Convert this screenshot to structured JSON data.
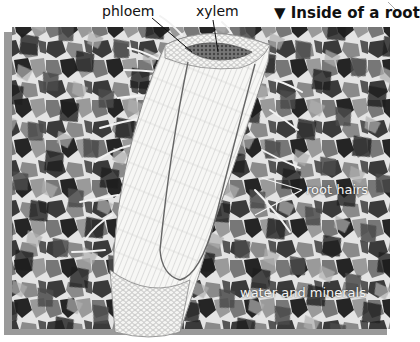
{
  "figure": {
    "title": "Inside of a root",
    "title_marker": "▼",
    "labels": {
      "phloem": "phloem",
      "xylem": "xylem",
      "root_hairs": "root hairs",
      "water_minerals": "water and minerals"
    }
  },
  "colors": {
    "background": "#ffffff",
    "soil_dark": "#2a2a2a",
    "soil_mid": "#6e6e6e",
    "soil_light": "#a8a8a8",
    "soil_gap": "#e6e6e6",
    "frame": "#9a9a9a",
    "root_fill": "#f4f4f2",
    "root_line": "#8a8a8a",
    "vascular_ring": "#5a5a5a",
    "text": "#111111"
  }
}
